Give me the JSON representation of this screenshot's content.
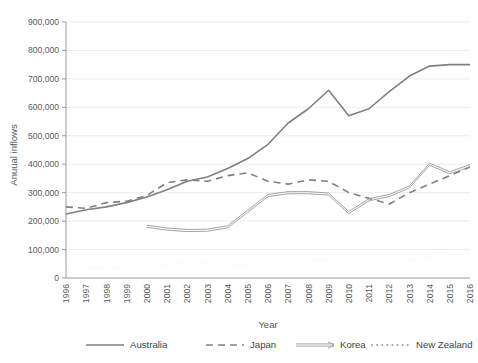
{
  "chart_data": {
    "type": "line",
    "title": "",
    "xlabel": "Year",
    "ylabel": "Anuual inflows",
    "x": [
      1996,
      1997,
      1998,
      1999,
      2000,
      2001,
      2002,
      2003,
      2004,
      2005,
      2006,
      2007,
      2008,
      2009,
      2010,
      2011,
      2012,
      2013,
      2014,
      2015,
      2016
    ],
    "categories": [
      "1996",
      "1997",
      "1998",
      "1999",
      "2000",
      "2001",
      "2002",
      "2003",
      "2004",
      "2005",
      "2006",
      "2007",
      "2008",
      "2009",
      "2010",
      "2011",
      "2012",
      "2013",
      "2014",
      "2015",
      "2016"
    ],
    "ylim": [
      0,
      900000
    ],
    "xlim": [
      1996,
      2016
    ],
    "yticks": [
      0,
      100000,
      200000,
      300000,
      400000,
      500000,
      600000,
      700000,
      800000,
      900000
    ],
    "ytick_labels": [
      "0",
      "100,000",
      "200,000",
      "300,000",
      "400,000",
      "500,000",
      "600,000",
      "700,000",
      "800,000",
      "900,000"
    ],
    "grid": true,
    "legend_position": "bottom",
    "series": [
      {
        "name": "Australia",
        "style": "solid",
        "color": "#808080",
        "values": [
          225000,
          240000,
          250000,
          265000,
          285000,
          310000,
          340000,
          355000,
          385000,
          420000,
          470000,
          545000,
          595000,
          660000,
          570000,
          595000,
          655000,
          710000,
          745000,
          750000,
          750000
        ]
      },
      {
        "name": "Japan",
        "style": "dashed",
        "color": "#808080",
        "values": [
          250000,
          245000,
          265000,
          270000,
          290000,
          335000,
          345000,
          340000,
          360000,
          370000,
          340000,
          330000,
          345000,
          340000,
          300000,
          280000,
          260000,
          300000,
          330000,
          360000,
          390000
        ]
      },
      {
        "name": "Korea",
        "style": "double",
        "color": "#9a9a9a",
        "values": [
          null,
          null,
          null,
          null,
          182000,
          172000,
          167000,
          168000,
          180000,
          235000,
          290000,
          300000,
          300000,
          295000,
          230000,
          275000,
          290000,
          320000,
          400000,
          370000,
          395000
        ]
      },
      {
        "name": "New Zealand",
        "style": "dotted",
        "color": "#a0a0a0",
        "values": [
          42000,
          38000,
          35000,
          37000,
          42000,
          48000,
          60000,
          52000,
          48000,
          45000,
          55000,
          60000,
          62000,
          62000,
          60000,
          58000,
          58000,
          62000,
          72000,
          82000,
          90000
        ]
      }
    ],
    "legend": [
      {
        "label": "Australia",
        "style": "solid"
      },
      {
        "label": "Japan",
        "style": "dashed"
      },
      {
        "label": "Korea",
        "style": "double"
      },
      {
        "label": "New Zealand",
        "style": "dotted"
      }
    ]
  }
}
